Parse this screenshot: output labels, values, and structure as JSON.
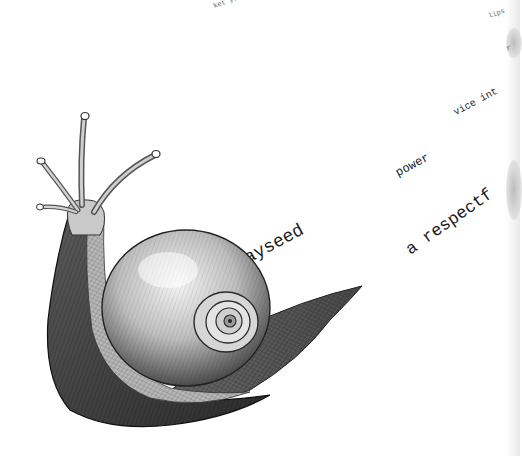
{
  "scene": {
    "subject": "engraved snail illustration",
    "background_color": "#ffffff"
  },
  "text_fragments": [
    {
      "id": "top-left",
      "text": "ket yo",
      "angle": -20
    },
    {
      "id": "top-right",
      "text": "lips",
      "angle": -20
    },
    {
      "id": "right-mid",
      "text": "r",
      "angle": -20
    },
    {
      "id": "vice",
      "text": "vice int",
      "angle": -28
    },
    {
      "id": "power",
      "text": "power",
      "angle": -28
    },
    {
      "id": "respectful",
      "text": "a respectf",
      "angle": -35
    },
    {
      "id": "hayseed",
      "text": "ayseed",
      "angle": -28
    }
  ]
}
